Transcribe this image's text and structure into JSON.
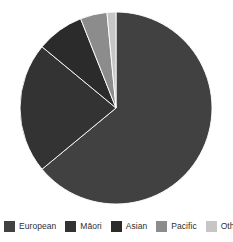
{
  "chart_data": {
    "type": "pie",
    "title": "",
    "subtitle": "",
    "categories": [
      "European",
      "Māori",
      "Asian",
      "Pacific",
      "Other"
    ],
    "values": [
      64.0,
      22.0,
      8.0,
      4.5,
      1.5
    ],
    "unit": "percent",
    "colors": [
      "#414141",
      "#333333",
      "#2b2b2b",
      "#8c8c8c",
      "#c6c6c6"
    ],
    "start_angle_deg": 0,
    "direction": "clockwise",
    "grid": false,
    "legend_position": "bottom",
    "legend_orientation": "horizontal",
    "background": "#ffffff",
    "center": {
      "x": 116,
      "y": 108
    },
    "radius": 96,
    "slices": [
      {
        "label": "European",
        "value": 64.0,
        "color": "#414141",
        "start_deg": 0,
        "end_deg": 230.4
      },
      {
        "label": "Māori",
        "value": 22.0,
        "color": "#333333",
        "start_deg": 230.4,
        "end_deg": 309.6
      },
      {
        "label": "Asian",
        "value": 8.0,
        "color": "#2b2b2b",
        "start_deg": 309.6,
        "end_deg": 338.4
      },
      {
        "label": "Pacific",
        "value": 4.5,
        "color": "#8c8c8c",
        "start_deg": 338.4,
        "end_deg": 354.6
      },
      {
        "label": "Other",
        "value": 1.5,
        "color": "#c6c6c6",
        "start_deg": 354.6,
        "end_deg": 360
      }
    ]
  },
  "legend": {
    "items": [
      {
        "label": "European",
        "color": "#414141"
      },
      {
        "label": "Māori",
        "color": "#333333"
      },
      {
        "label": "Asian",
        "color": "#2b2b2b"
      },
      {
        "label": "Pacific",
        "color": "#8c8c8c"
      },
      {
        "label": "Other",
        "color": "#c6c6c6"
      }
    ]
  }
}
